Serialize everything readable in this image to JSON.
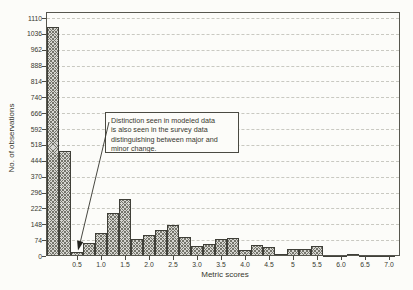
{
  "chart_data": {
    "type": "bar",
    "title": "",
    "xlabel": "Metric scores",
    "ylabel": "No. of observations",
    "bin_width": 0.25,
    "x": [
      0,
      0.25,
      0.5,
      0.75,
      1,
      1.25,
      1.5,
      1.75,
      2,
      2.25,
      2.5,
      2.75,
      3,
      3.25,
      3.5,
      3.75,
      4,
      4.25,
      4.5,
      4.75,
      5,
      5.25,
      5.5,
      5.75,
      6,
      6.25,
      6.5,
      6.75,
      7
    ],
    "values": [
      1070,
      490,
      20,
      60,
      105,
      200,
      265,
      80,
      100,
      120,
      145,
      90,
      45,
      55,
      80,
      85,
      30,
      50,
      40,
      8,
      32,
      32,
      48,
      1,
      1,
      8,
      4,
      1,
      1
    ],
    "y_ticks": [
      0,
      74,
      148,
      222,
      296,
      370,
      444,
      518,
      592,
      666,
      740,
      814,
      888,
      962,
      1036,
      1110
    ],
    "x_ticks": [
      0.5,
      1,
      1.5,
      2,
      2.5,
      3,
      3.5,
      4,
      4.5,
      5,
      5.5,
      6,
      6.5,
      7
    ],
    "x_tick_labels": [
      "0.5",
      "1.0",
      "1.5",
      "2.0",
      "2.5",
      "3.0",
      "3.5",
      "4.0",
      "4.5",
      "5",
      "5.5",
      "6.0",
      "6.5",
      "7.0"
    ],
    "ylim": [
      0,
      1138
    ],
    "xlim": [
      -0.15,
      7.22
    ],
    "grid": "horizontal-dashed",
    "legend": null
  },
  "annotation": {
    "lines": [
      "Distinction seen in modeled data",
      "is also seen in the survey data",
      "distinguishing between major and",
      "minor change."
    ],
    "text": "Distinction seen in modeled data is also seen in the survey data distinguishing between major and minor change.",
    "arrow_points_to": "bar at metric score 0.5"
  },
  "colors": {
    "background": "#fcfcf9",
    "bar_fill": "#d6d6d1",
    "bar_hatch": "#75756c",
    "bar_border": "#3f3f38",
    "grid": "#c9c9c1",
    "frame": "#56564e",
    "text": "#38382f",
    "arrow": "#33332c"
  }
}
